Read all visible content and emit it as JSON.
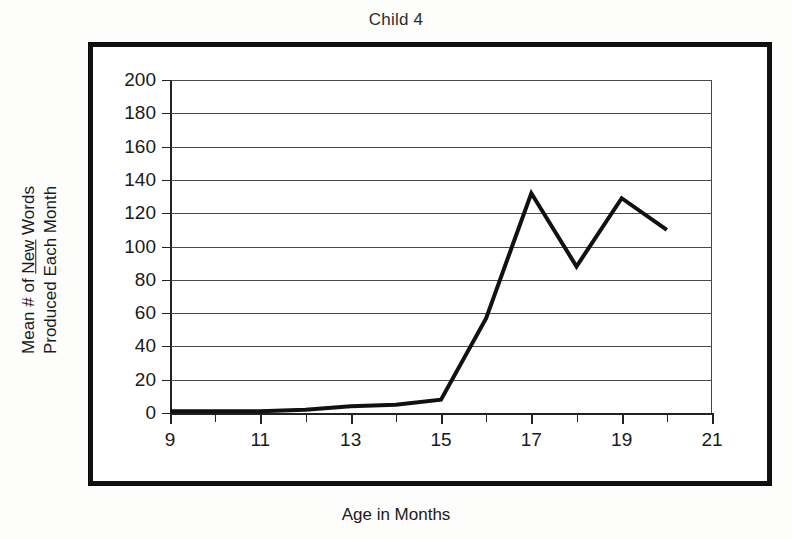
{
  "chart_data": {
    "type": "line",
    "title": "Child 4",
    "xlabel": "Age in Months",
    "ylabel_line1_pre": "Mean # of ",
    "ylabel_line1_underlined": "New",
    "ylabel_line1_post": " Words",
    "ylabel_line2": "Produced Each Month",
    "ylabel_full": "Mean # of New Words Produced Each Month",
    "x": [
      9,
      10,
      11,
      12,
      13,
      14,
      15,
      16,
      17,
      18,
      19,
      20
    ],
    "values": [
      1,
      1,
      1,
      2,
      4,
      5,
      8,
      57,
      132,
      88,
      129,
      110
    ],
    "series": [
      {
        "name": "Child 4",
        "values": [
          1,
          1,
          1,
          2,
          4,
          5,
          8,
          57,
          132,
          88,
          129,
          110
        ]
      }
    ],
    "xlim": [
      9,
      21
    ],
    "ylim": [
      0,
      200
    ],
    "xticks": [
      9,
      10,
      11,
      12,
      13,
      14,
      15,
      16,
      17,
      18,
      19,
      20,
      21
    ],
    "xtick_labels": [
      "9",
      "",
      "11",
      "",
      "13",
      "",
      "15",
      "",
      "17",
      "",
      "19",
      "",
      "21"
    ],
    "xtick_labels_major": [
      "9",
      "11",
      "13",
      "15",
      "17",
      "19",
      "21"
    ],
    "yticks": [
      0,
      20,
      40,
      60,
      80,
      100,
      120,
      140,
      160,
      180,
      200
    ],
    "ytick_labels": [
      "0",
      "20",
      "40",
      "60",
      "80",
      "100",
      "120",
      "140",
      "160",
      "180",
      "200"
    ],
    "grid": true,
    "grid_axis": "y",
    "legend": false,
    "legend_position": "none",
    "line_color": "#111111",
    "line_width": 4,
    "markers": false,
    "frame_color": "#111111",
    "background_color": "#ffffff"
  }
}
